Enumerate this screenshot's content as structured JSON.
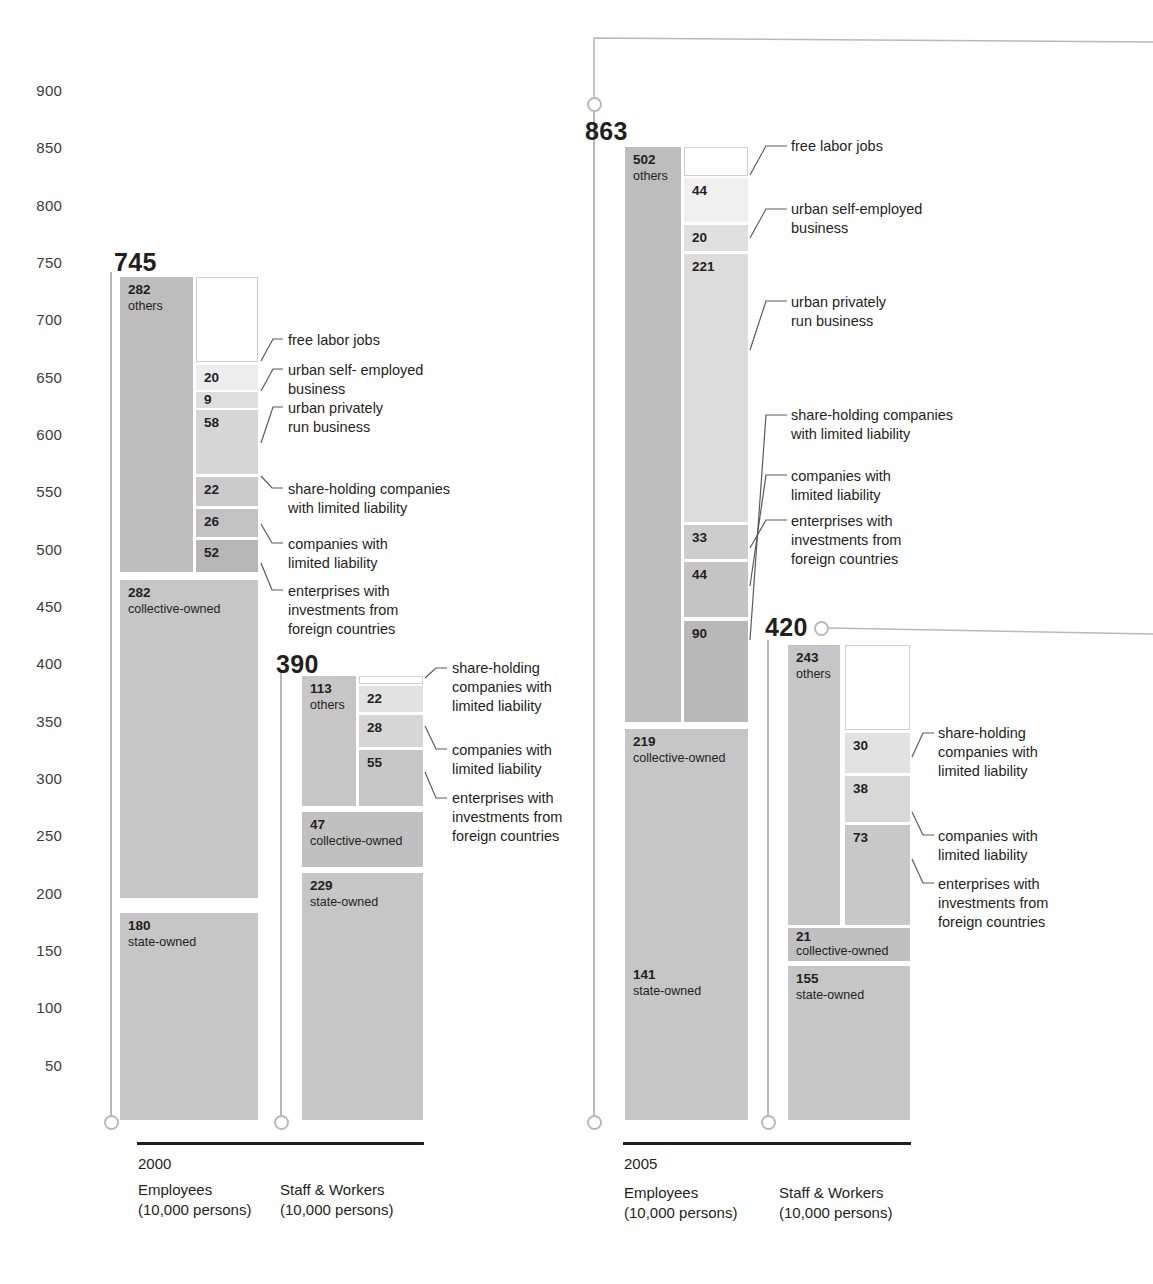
{
  "axis": {
    "ticks": [
      900,
      850,
      800,
      750,
      700,
      650,
      600,
      550,
      500,
      450,
      400,
      350,
      300,
      250,
      200,
      150,
      100,
      50
    ],
    "unit_note": "(10,000 persons)"
  },
  "groups": [
    {
      "year": "2000",
      "columns": [
        {
          "caption": "Employees\n(10,000 persons)",
          "total": "745"
        },
        {
          "caption": "Staff & Workers\n(10,000 persons)",
          "total": "390"
        }
      ]
    },
    {
      "year": "2005",
      "columns": [
        {
          "caption": "Employees\n(10,000 persons)",
          "total": "863"
        },
        {
          "caption": "Staff & Workers\n(10,000 persons)",
          "total": "420"
        }
      ]
    }
  ],
  "labels": {
    "free_labor_jobs": "free labor jobs",
    "urban_self_employed_2000": "urban self- employed\nbusiness",
    "urban_self_employed_2005": "urban self-employed\nbusiness",
    "urban_private": "urban privately\nrun business",
    "share_holding_wide": "share-holding companies\nwith limited liability",
    "share_holding_narrow": "share-holding\ncompanies with\nlimited liability",
    "limited_liability": "companies with\nlimited liability",
    "foreign_invested": "enterprises with\ninvestments from\nforeign countries",
    "others": "others",
    "collective": "collective-owned",
    "state": "state-owned"
  },
  "colors": {
    "ownership_others": "#bdbdbd",
    "ownership_collective": "#c6c6c6",
    "ownership_state": "#c6c6c6",
    "free_labor": "#ffffff",
    "self_employed": "#ededed",
    "private": "#dedede",
    "share_holding": "#cfcfcf",
    "limited_liability": "#c2c2c2",
    "foreign": "#b5b5b5",
    "stem": "#b9b9b9",
    "rule": "#231f20",
    "text": "#231f20"
  },
  "chart_data": {
    "type": "bar",
    "title": "",
    "ylabel": "",
    "xlabel": "",
    "ylim": [
      0,
      900
    ],
    "grid": false,
    "legend": "callout-annotations",
    "unit": "10,000 persons",
    "series": [
      {
        "group": "2000",
        "column": "Employees",
        "total": 745,
        "ownership_stack": [
          {
            "name": "others",
            "value": 282
          },
          {
            "name": "collective-owned",
            "value": 282
          },
          {
            "name": "state-owned",
            "value": 180
          }
        ],
        "others_breakdown": [
          {
            "name": "free labor jobs",
            "value": 95
          },
          {
            "name": "urban self- employed business",
            "value": 20
          },
          {
            "name": "urban privately run business",
            "value": 9
          },
          {
            "name": "share-holding companies with limited liability",
            "value": 58
          },
          {
            "name": "companies with limited liability",
            "value": 22
          },
          {
            "name": "enterprises with investments from foreign countries",
            "value": 26
          },
          {
            "name": "state-unit-other",
            "value": 52
          }
        ],
        "labeled_subsegments": [
          20,
          9,
          58,
          22,
          26,
          52
        ]
      },
      {
        "group": "2000",
        "column": "Staff & Workers",
        "total": 390,
        "ownership_stack": [
          {
            "name": "others",
            "value": 113
          },
          {
            "name": "collective-owned",
            "value": 47
          },
          {
            "name": "state-owned",
            "value": 229
          }
        ],
        "labeled_subsegments": [
          22,
          28,
          55
        ]
      },
      {
        "group": "2005",
        "column": "Employees",
        "total": 863,
        "ownership_stack": [
          {
            "name": "others",
            "value": 502
          },
          {
            "name": "collective-owned",
            "value": 219
          },
          {
            "name": "state-owned",
            "value": 141
          }
        ],
        "labeled_subsegments": [
          44,
          20,
          221,
          33,
          44,
          90
        ]
      },
      {
        "group": "2005",
        "column": "Staff & Workers",
        "total": 420,
        "ownership_stack": [
          {
            "name": "others",
            "value": 243
          },
          {
            "name": "collective-owned",
            "value": 21
          },
          {
            "name": "state-owned",
            "value": 155
          }
        ],
        "labeled_subsegments": [
          30,
          38,
          73
        ]
      }
    ]
  },
  "segments": {
    "e2000": {
      "others_v": "282",
      "others_n": "others",
      "collective_v": "282",
      "collective_n": "collective-owned",
      "state_v": "180",
      "state_n": "state-owned",
      "s1": "20",
      "s2": "9",
      "s3": "58",
      "s4": "22",
      "s5": "26",
      "s6": "52"
    },
    "s2000": {
      "others_v": "113",
      "others_n": "others",
      "collective_v": "47",
      "collective_n": "collective-owned",
      "state_v": "229",
      "state_n": "state-owned",
      "s1": "22",
      "s2": "28",
      "s3": "55"
    },
    "e2005": {
      "others_v": "502",
      "others_n": "others",
      "collective_v": "219",
      "collective_n": "collective-owned",
      "state_v": "141",
      "state_n": "state-owned",
      "s1": "44",
      "s2": "20",
      "s3": "221",
      "s4": "33",
      "s5": "44",
      "s6": "90"
    },
    "s2005": {
      "others_v": "243",
      "others_n": "others",
      "collective_v": "21",
      "collective_n": "collective-owned",
      "state_v": "155",
      "state_n": "state-owned",
      "s1": "30",
      "s2": "38",
      "s3": "73"
    }
  }
}
